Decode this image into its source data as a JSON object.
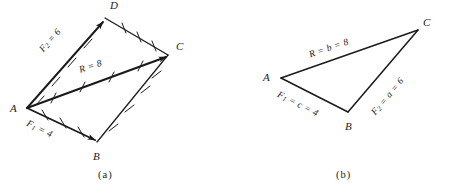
{
  "figure": {
    "background_color": "#ffffff",
    "ink_color": "#1a1a1a",
    "panels": [
      {
        "id": "a",
        "caption": "(a)",
        "method": "parallelogram",
        "vertices": [
          {
            "name": "A",
            "label": "A",
            "x": 27,
            "y": 108
          },
          {
            "name": "B",
            "label": "B",
            "x": 97,
            "y": 142
          },
          {
            "name": "C",
            "label": "C",
            "x": 168,
            "y": 55
          },
          {
            "name": "D",
            "label": "D",
            "x": 105,
            "y": 18
          }
        ],
        "edges": [
          {
            "from": "A",
            "to": "D",
            "label": "F2 = 6",
            "label_text": "F",
            "sub": "2",
            "rest": " = 6",
            "value": 6,
            "arrow": true,
            "ticks": 4
          },
          {
            "from": "A",
            "to": "B",
            "label": "F1 = 4",
            "label_text": "F",
            "sub": "1",
            "rest": " = 4",
            "value": 4,
            "arrow": true,
            "ticks": 3
          },
          {
            "from": "A",
            "to": "C",
            "label": "R = 8",
            "label_text": "R",
            "sub": "",
            "rest": " = 8",
            "value": 8,
            "arrow": true,
            "ticks": 4
          },
          {
            "from": "D",
            "to": "C",
            "label": "",
            "label_text": "",
            "sub": "",
            "rest": "",
            "value": 4,
            "arrow": false,
            "ticks": 3
          },
          {
            "from": "B",
            "to": "C",
            "label": "",
            "label_text": "",
            "sub": "",
            "rest": "",
            "value": 6,
            "arrow": false,
            "ticks": 4
          }
        ],
        "segment_labels": [
          {
            "name": "force-2-label",
            "text_main": "F",
            "sub": "2",
            "tail": " = 6",
            "x": 38,
            "y": 48,
            "rotate": -58
          },
          {
            "name": "resultant-label",
            "text_main": "R",
            "sub": "",
            "tail": " = 8",
            "x": 80,
            "y": 70,
            "rotate": -17
          },
          {
            "name": "force-1-label",
            "text_main": "F",
            "sub": "1",
            "tail": " = 4",
            "x": 30,
            "y": 121,
            "rotate": 26
          }
        ]
      },
      {
        "id": "b",
        "caption": "(b)",
        "method": "triangle",
        "vertices": [
          {
            "name": "A",
            "label": "A",
            "x": 56,
            "y": 78
          },
          {
            "name": "B",
            "label": "B",
            "x": 123,
            "y": 112
          },
          {
            "name": "C",
            "label": "C",
            "x": 193,
            "y": 30
          }
        ],
        "edges": [
          {
            "from": "A",
            "to": "C",
            "label": "R = b = 8",
            "value": 8
          },
          {
            "from": "A",
            "to": "B",
            "label": "F1 = c = 4",
            "value": 4
          },
          {
            "from": "B",
            "to": "C",
            "label": "F2 = a = 6",
            "value": 6
          }
        ],
        "segment_labels": [
          {
            "name": "resultant-label",
            "text_main": "R",
            "sub": "",
            "tail": " = b = 8",
            "x": 84,
            "y": 53,
            "rotate": -18
          },
          {
            "name": "force-1-label",
            "text_main": "F",
            "sub": "1",
            "tail": " = c = 4",
            "x": 56,
            "y": 92,
            "rotate": 27
          },
          {
            "name": "force-2-label",
            "text_main": "F",
            "sub": "2",
            "tail": " = a = 6",
            "x": 146,
            "y": 110,
            "rotate": -50
          }
        ]
      }
    ]
  }
}
